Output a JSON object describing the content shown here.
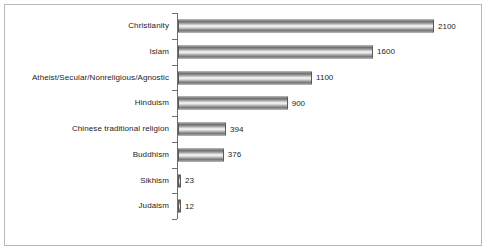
{
  "chart_data": {
    "type": "bar",
    "orientation": "horizontal",
    "title": "",
    "xlabel": "",
    "ylabel": "",
    "grid": false,
    "legend": false,
    "xlim": [
      0,
      2100
    ],
    "categories": [
      "Christianity",
      "Islam",
      "Atheist/Secular/Nonreligious/Agnostic",
      "Hinduism",
      "Chinese traditional religion",
      "Buddhism",
      "Sikhism",
      "Judaism"
    ],
    "values": [
      2100,
      1600,
      1100,
      900,
      394,
      376,
      23,
      12
    ],
    "value_labels": [
      "2100",
      "1600",
      "1100",
      "900",
      "394",
      "376",
      "23",
      "12"
    ]
  },
  "style": {
    "bar_border": "#5a5a5a",
    "axis_color": "#6e6e6e",
    "frame_color": "#b9b9b9",
    "text_color": "#1d1d1d",
    "background": "#ffffff"
  }
}
